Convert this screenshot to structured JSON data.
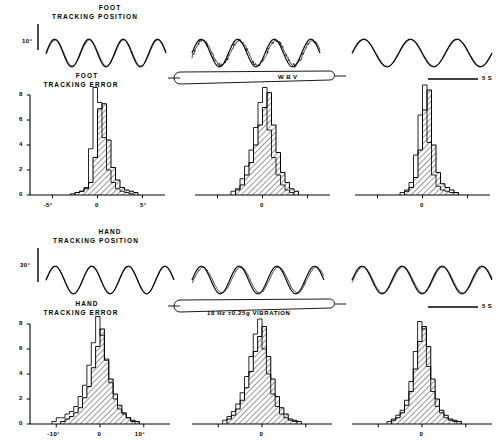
{
  "figure": {
    "title_rows": [
      {
        "name": "foot-position",
        "label_line1": "FOOT",
        "label_line2": "TRACKING POSITION",
        "scale": "10°"
      },
      {
        "name": "foot-error",
        "label_line1": "FOOT",
        "label_line2": "TRACKING  ERROR"
      },
      {
        "name": "hand-position",
        "label_line1": "HAND",
        "label_line2": "TRACKING  POSITION",
        "scale": "30°"
      },
      {
        "name": "hand-error",
        "label_line1": "HAND",
        "label_line2": "TRACKING  ERROR"
      }
    ],
    "annotations": {
      "wbv_bar_label": "W B V",
      "vibration_bar_label": "18 Hz  ±0.25g    VIBRATION",
      "time_scale_label": "5 S",
      "zero_label": "0"
    },
    "columns": [
      {
        "name": "before",
        "index": 0
      },
      {
        "name": "during",
        "index": 1
      },
      {
        "name": "after",
        "index": 2
      }
    ]
  },
  "chart_data": [
    {
      "type": "line",
      "name": "foot-tracking-position-before",
      "title": "FOOT TRACKING POSITION",
      "ylabel": "10°",
      "xlabel": "",
      "grid": false,
      "legend": [
        "target",
        "response"
      ],
      "series": [
        {
          "name": "target",
          "cycles": 3.5,
          "amplitude": 1.0,
          "phase": 0.0,
          "jitter": 0.0
        },
        {
          "name": "response",
          "cycles": 3.5,
          "amplitude": 0.95,
          "phase": 0.12,
          "jitter": 0.1
        }
      ]
    },
    {
      "type": "line",
      "name": "foot-tracking-position-during",
      "title": "FOOT TRACKING POSITION (WBV)",
      "ylabel": "10°",
      "grid": false,
      "legend": [
        "target",
        "response"
      ],
      "series": [
        {
          "name": "target",
          "cycles": 3.5,
          "amplitude": 1.0,
          "phase": 0.0,
          "jitter": 0.0
        },
        {
          "name": "response",
          "cycles": 3.5,
          "amplitude": 0.9,
          "phase": 0.3,
          "jitter": 0.35
        }
      ]
    },
    {
      "type": "line",
      "name": "foot-tracking-position-after",
      "title": "FOOT TRACKING POSITION (post)",
      "ylabel": "10°",
      "grid": false,
      "legend": [
        "target",
        "response"
      ],
      "series": [
        {
          "name": "target",
          "cycles": 3.0,
          "amplitude": 1.0,
          "phase": 0.0,
          "jitter": 0.0
        },
        {
          "name": "response",
          "cycles": 3.0,
          "amplitude": 0.97,
          "phase": 0.07,
          "jitter": 0.05
        }
      ]
    },
    {
      "type": "bar",
      "name": "foot-tracking-error-before",
      "title": "FOOT TRACKING ERROR",
      "xlabel": "",
      "ylabel": "",
      "xlim": [
        -7.5,
        7.5
      ],
      "ylim": [
        0,
        8
      ],
      "yticks": [
        0,
        2,
        4,
        6,
        8
      ],
      "xticks": [
        -5,
        0,
        5
      ],
      "xtick_labels": [
        "-5°",
        "0",
        "5°"
      ],
      "bin_width": 0.5,
      "series": [
        {
          "name": "outline",
          "hatched": false,
          "bins": [
            -3.0,
            -2.5,
            -2.0,
            -1.5,
            -1.0,
            -0.5,
            0.0,
            0.5,
            1.0,
            1.5,
            2.0,
            2.5,
            3.0,
            3.5
          ],
          "values": [
            0.1,
            0.2,
            0.3,
            0.6,
            3.7,
            8.6,
            7.4,
            4.6,
            2.0,
            1.0,
            0.5,
            0.3,
            0.2,
            0.1
          ]
        },
        {
          "name": "hatched",
          "hatched": true,
          "bins": [
            -2.5,
            -2.0,
            -1.5,
            -1.0,
            -0.5,
            0.0,
            0.5,
            1.0,
            1.5,
            2.0,
            2.5,
            3.0,
            3.5,
            4.0
          ],
          "values": [
            0.2,
            0.3,
            0.5,
            1.0,
            3.0,
            6.9,
            7.3,
            4.4,
            2.2,
            1.2,
            0.6,
            0.4,
            0.3,
            0.2
          ]
        }
      ]
    },
    {
      "type": "bar",
      "name": "foot-tracking-error-during",
      "title": "FOOT TRACKING ERROR (WBV)",
      "xlim": [
        -7.5,
        7.5
      ],
      "ylim": [
        0,
        8
      ],
      "xticks": [
        -5,
        0,
        5
      ],
      "xtick_labels": [
        "",
        "0",
        ""
      ],
      "bin_width": 0.5,
      "series": [
        {
          "name": "outline",
          "hatched": false,
          "bins": [
            -3.5,
            -3.0,
            -2.5,
            -2.0,
            -1.5,
            -1.0,
            -0.5,
            0.0,
            0.5,
            1.0,
            1.5,
            2.0,
            2.5,
            3.0
          ],
          "values": [
            0.3,
            0.5,
            1.3,
            2.3,
            3.6,
            5.4,
            7.4,
            8.6,
            5.2,
            3.0,
            1.6,
            0.8,
            0.4,
            0.2
          ]
        },
        {
          "name": "hatched",
          "hatched": true,
          "bins": [
            -3.0,
            -2.5,
            -2.0,
            -1.5,
            -1.0,
            -0.5,
            0.0,
            0.5,
            1.0,
            1.5,
            2.0,
            2.5,
            3.0,
            3.5
          ],
          "values": [
            0.4,
            0.8,
            1.6,
            2.6,
            4.0,
            5.6,
            7.0,
            8.2,
            5.6,
            3.4,
            1.8,
            1.0,
            0.5,
            0.3
          ]
        }
      ]
    },
    {
      "type": "bar",
      "name": "foot-tracking-error-after",
      "title": "FOOT TRACKING ERROR (post)",
      "xlim": [
        -7.5,
        7.5
      ],
      "ylim": [
        0,
        8
      ],
      "xticks": [
        -5,
        0,
        5
      ],
      "xtick_labels": [
        "",
        "0",
        ""
      ],
      "bin_width": 0.5,
      "series": [
        {
          "name": "outline",
          "hatched": false,
          "bins": [
            -2.5,
            -2.0,
            -1.5,
            -1.0,
            -0.5,
            0.0,
            0.5,
            1.0,
            1.5,
            2.0,
            2.5,
            3.0
          ],
          "values": [
            0.2,
            0.4,
            1.0,
            3.2,
            6.4,
            8.8,
            4.2,
            1.6,
            0.7,
            0.4,
            0.3,
            0.2
          ]
        },
        {
          "name": "hatched",
          "hatched": true,
          "bins": [
            -2.0,
            -1.5,
            -1.0,
            -0.5,
            0.0,
            0.5,
            1.0,
            1.5,
            2.0,
            2.5,
            3.0,
            3.5
          ],
          "values": [
            0.3,
            0.6,
            1.4,
            3.6,
            6.8,
            8.4,
            4.0,
            1.8,
            0.9,
            0.6,
            0.4,
            0.2
          ]
        }
      ]
    },
    {
      "type": "line",
      "name": "hand-tracking-position-before",
      "title": "HAND TRACKING POSITION",
      "ylabel": "30°",
      "grid": false,
      "legend": [
        "target",
        "response"
      ],
      "series": [
        {
          "name": "target",
          "cycles": 3.5,
          "amplitude": 1.0,
          "phase": 0.0,
          "jitter": 0.0
        },
        {
          "name": "response",
          "cycles": 3.5,
          "amplitude": 0.98,
          "phase": 0.05,
          "jitter": 0.03
        }
      ]
    },
    {
      "type": "line",
      "name": "hand-tracking-position-during",
      "title": "HAND TRACKING POSITION (VIBRATION)",
      "ylabel": "30°",
      "grid": false,
      "legend": [
        "target",
        "response"
      ],
      "series": [
        {
          "name": "target",
          "cycles": 3.5,
          "amplitude": 1.0,
          "phase": 0.0,
          "jitter": 0.0
        },
        {
          "name": "response",
          "cycles": 3.5,
          "amplitude": 0.93,
          "phase": 0.28,
          "jitter": 0.12
        }
      ]
    },
    {
      "type": "line",
      "name": "hand-tracking-position-after",
      "title": "HAND TRACKING POSITION (post)",
      "ylabel": "30°",
      "grid": false,
      "legend": [
        "target",
        "response"
      ],
      "series": [
        {
          "name": "target",
          "cycles": 3.5,
          "amplitude": 1.0,
          "phase": 0.0,
          "jitter": 0.0
        },
        {
          "name": "response",
          "cycles": 3.5,
          "amplitude": 0.95,
          "phase": 0.16,
          "jitter": 0.08
        }
      ]
    },
    {
      "type": "bar",
      "name": "hand-tracking-error-before",
      "title": "HAND TRACKING ERROR",
      "xlim": [
        -16,
        16
      ],
      "ylim": [
        0,
        8
      ],
      "yticks": [
        0,
        2,
        4,
        6,
        8
      ],
      "xticks": [
        -10,
        0,
        10
      ],
      "xtick_labels": [
        "-10°",
        "0",
        "10°"
      ],
      "bin_width": 1.0,
      "series": [
        {
          "name": "outline",
          "hatched": false,
          "bins": [
            -11,
            -10,
            -9,
            -8,
            -7,
            -6,
            -5,
            -4,
            -3,
            -2,
            -1,
            0,
            1,
            2,
            3,
            4,
            5,
            6,
            7
          ],
          "values": [
            0.2,
            0.5,
            0.5,
            0.8,
            1.0,
            1.4,
            2.2,
            3.1,
            4.7,
            6.5,
            8.6,
            7.1,
            5.2,
            3.3,
            2.0,
            1.2,
            0.8,
            0.5,
            0.2
          ]
        },
        {
          "name": "hatched",
          "hatched": true,
          "bins": [
            -9,
            -8,
            -7,
            -6,
            -5,
            -4,
            -3,
            -2,
            -1,
            0,
            1,
            2,
            3,
            4,
            5,
            6,
            7,
            8
          ],
          "values": [
            0.2,
            0.4,
            0.6,
            0.9,
            1.3,
            2.1,
            3.0,
            4.5,
            6.2,
            7.6,
            5.1,
            3.6,
            2.4,
            1.5,
            0.9,
            0.5,
            0.3,
            0.2
          ]
        }
      ]
    },
    {
      "type": "bar",
      "name": "hand-tracking-error-during",
      "title": "HAND TRACKING ERROR (VIBRATION)",
      "xlim": [
        -16,
        16
      ],
      "ylim": [
        0,
        8
      ],
      "xticks": [
        -10,
        0,
        10
      ],
      "xtick_labels": [
        "",
        "0",
        ""
      ],
      "bin_width": 1.0,
      "series": [
        {
          "name": "outline",
          "hatched": false,
          "bins": [
            -9,
            -8,
            -7,
            -6,
            -5,
            -4,
            -3,
            -2,
            -1,
            0,
            1,
            2,
            3,
            4,
            5,
            6,
            7
          ],
          "values": [
            0.3,
            0.6,
            1.0,
            1.6,
            2.5,
            3.8,
            5.4,
            7.2,
            8.4,
            6.0,
            4.0,
            2.4,
            1.4,
            0.8,
            0.5,
            0.3,
            0.2
          ]
        },
        {
          "name": "hatched",
          "hatched": true,
          "bins": [
            -8,
            -7,
            -6,
            -5,
            -4,
            -3,
            -2,
            -1,
            0,
            1,
            2,
            3,
            4,
            5,
            6,
            7,
            8
          ],
          "values": [
            0.4,
            0.7,
            1.2,
            1.9,
            2.9,
            4.2,
            5.8,
            7.0,
            7.8,
            5.4,
            3.6,
            2.2,
            1.3,
            0.8,
            0.4,
            0.3,
            0.2
          ]
        }
      ]
    },
    {
      "type": "bar",
      "name": "hand-tracking-error-after",
      "title": "HAND TRACKING ERROR (post)",
      "xlim": [
        -16,
        16
      ],
      "ylim": [
        0,
        8
      ],
      "xticks": [
        -10,
        0,
        10
      ],
      "xtick_labels": [
        "",
        "0",
        ""
      ],
      "bin_width": 1.0,
      "series": [
        {
          "name": "outline",
          "hatched": false,
          "bins": [
            -8,
            -7,
            -6,
            -5,
            -4,
            -3,
            -2,
            -1,
            0,
            1,
            2,
            3,
            4,
            5,
            6,
            7
          ],
          "values": [
            0.2,
            0.4,
            0.7,
            1.1,
            1.9,
            3.4,
            5.8,
            8.2,
            7.6,
            4.6,
            2.6,
            1.4,
            0.9,
            0.5,
            0.3,
            0.2
          ]
        },
        {
          "name": "hatched",
          "hatched": true,
          "bins": [
            -7,
            -6,
            -5,
            -4,
            -3,
            -2,
            -1,
            0,
            1,
            2,
            3,
            4,
            5,
            6,
            7,
            8
          ],
          "values": [
            0.3,
            0.5,
            0.9,
            1.5,
            2.6,
            4.4,
            6.6,
            7.8,
            6.2,
            3.6,
            2.0,
            1.1,
            0.7,
            0.4,
            0.3,
            0.2
          ]
        }
      ]
    }
  ]
}
